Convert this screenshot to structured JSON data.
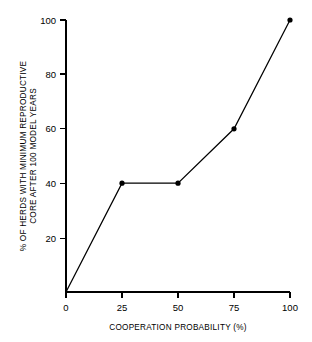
{
  "chart_data": {
    "type": "line",
    "title": "",
    "xlabel": "COOPERATION PROBABILITY (%)",
    "ylabel": "% OF HERDS WITH MINIMUM REPRODUCTIVE CORE AFTER 100 MODEL YEARS",
    "ylabel_line1": "% OF HERDS WITH MINIMUM REPRODUCTIVE",
    "ylabel_line2": "CORE AFTER 100 MODEL YEARS",
    "x": [
      0,
      25,
      50,
      75,
      100
    ],
    "values": [
      0,
      40,
      40,
      60,
      100
    ],
    "points": [
      {
        "x": 0,
        "y": 0
      },
      {
        "x": 25,
        "y": 40
      },
      {
        "x": 50,
        "y": 40
      },
      {
        "x": 75,
        "y": 60
      },
      {
        "x": 100,
        "y": 100
      }
    ],
    "xlim": [
      0,
      100
    ],
    "ylim": [
      0,
      100
    ],
    "xticks": [
      0,
      25,
      50,
      75,
      100
    ],
    "yticks": [
      20,
      40,
      60,
      80,
      100
    ],
    "xtick_labels": [
      "0",
      "25",
      "50",
      "75",
      "100"
    ],
    "ytick_labels": [
      "20",
      "40",
      "60",
      "80",
      "100"
    ],
    "grid": false,
    "legend": null,
    "marker": "filled-circle",
    "line_color": "#000000",
    "marker_color": "#000000",
    "background_color": "#ffffff"
  },
  "axes": {
    "x_tick_0": "0",
    "x_tick_1": "25",
    "x_tick_2": "50",
    "x_tick_3": "75",
    "x_tick_4": "100",
    "y_tick_0": "20",
    "y_tick_1": "40",
    "y_tick_2": "60",
    "y_tick_3": "80",
    "y_tick_4": "100"
  }
}
